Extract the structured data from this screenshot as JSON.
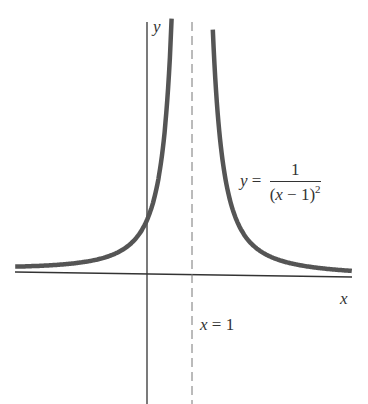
{
  "chart_data": {
    "type": "line",
    "title": "",
    "xlabel": "x",
    "ylabel": "y",
    "function": "y = 1/(x-1)^2",
    "series": [
      {
        "name": "y = 1/(x-1)^2",
        "x": [
          -3,
          -2,
          -1,
          0,
          0.5,
          0.75,
          1.25,
          1.5,
          2,
          3,
          4,
          5
        ],
        "y": [
          0.0625,
          0.111,
          0.25,
          1,
          4,
          16,
          16,
          4,
          1,
          0.25,
          0.111,
          0.0625
        ]
      }
    ],
    "asymptotes": {
      "vertical": "x = 1",
      "horizontal": "y = 0"
    },
    "grid": false,
    "legend": null
  },
  "labels": {
    "y_axis": "y",
    "x_axis": "x",
    "asymptote": "x = 1",
    "equation_lhs": "y =",
    "equation_num": "1",
    "equation_den_base": "(x − 1)",
    "equation_den_exp": "2"
  },
  "colors": {
    "axis": "#333333",
    "curve": "#555555",
    "asymptote": "#777777"
  }
}
